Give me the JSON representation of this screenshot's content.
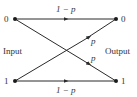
{
  "diagram": {
    "input_label": "Input",
    "output_label": "Output",
    "nodes": {
      "input_0": "0",
      "input_1": "1",
      "output_0": "0",
      "output_1": "1"
    },
    "edges": {
      "top_straight": "1 − p",
      "bottom_straight": "1 − p",
      "cross_up": "p",
      "cross_down": "p"
    },
    "colors": {
      "line": "#2a2a2a",
      "text": "#333333",
      "background": "#ffffff"
    }
  }
}
